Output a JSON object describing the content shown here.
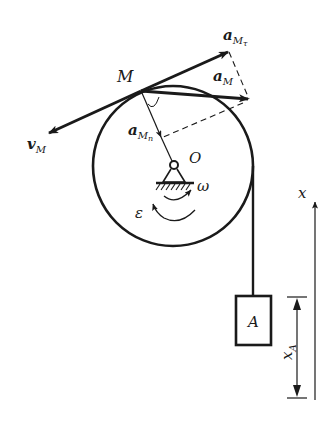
{
  "diagram": {
    "labels": {
      "point_M": "M",
      "center_O": "O",
      "omega": "ω",
      "epsilon": "ε",
      "block": "A",
      "x_axis": "x",
      "x_A_main": "x",
      "x_A_sub": "A",
      "v_M_main": "v",
      "v_M_sub": "M",
      "a_M_main": "a",
      "a_M_sub": "M",
      "a_Mt_main": "a",
      "a_Mt_sub": "M",
      "a_Mt_subsub": "τ",
      "a_Mn_main": "a",
      "a_Mn_sub": "M",
      "a_Mn_subsub": "n"
    },
    "vectors": [
      {
        "name": "v_M",
        "meaning": "velocity of point M, tangent to pulley"
      },
      {
        "name": "a_Mτ",
        "meaning": "tangential acceleration of M"
      },
      {
        "name": "a_M",
        "meaning": "total acceleration of M"
      },
      {
        "name": "a_Mn",
        "meaning": "normal acceleration of M, toward O"
      }
    ],
    "colors": {
      "ink": "#1a1a1a",
      "background": "#ffffff"
    }
  }
}
